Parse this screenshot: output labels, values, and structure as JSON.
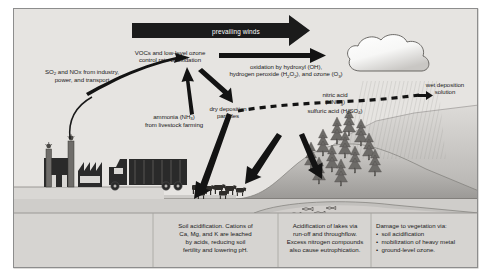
{
  "figure": {
    "panel_bg": "#e6e4e1",
    "ink": "#1a1a1a"
  },
  "banner": {
    "label": "prevailing winds",
    "color": "#1b1b1b",
    "text_color": "#ffffff"
  },
  "labels": {
    "sources": "SO2 and NOx from industry, power, and transport",
    "sources_l1": "SO",
    "sources_l1b": " and NOx from industry,",
    "sources_l2": "power, and transport",
    "vocs_l1": "VOCs and low-level ozone",
    "vocs_l2": "control rate of oxidation",
    "oxidation_l1": "oxidation by hydroxyl (OH),",
    "oxidation_l2a": "hydrogen peroxide (H",
    "oxidation_l2b": "O",
    "oxidation_l2c": "), and ozone (O",
    "oxidation_l2d": ")",
    "ammonia_l1a": "ammonia (NH",
    "ammonia_l1b": ")",
    "ammonia_l2": "from livestock farming",
    "dry_dep_l1": "dry deposition",
    "dry_dep_l2": "particles",
    "acids_l1": "nitric acid",
    "acids_l2a": "(HNO",
    "acids_l2b": ")",
    "acids_l3a": "sulfuric acid (H",
    "acids_l3b": "SO",
    "acids_l3c": ")",
    "wet_dep_l1": "wet deposition",
    "wet_dep_l2": "solution"
  },
  "bottom_boxes": [
    {
      "name": "soil-acidification",
      "lines": [
        "Soil acidification. Cations of",
        "Ca, Mg, and K are leached",
        "by acids, reducing soil",
        "fertility and lowering pH."
      ]
    },
    {
      "name": "lake-acidification",
      "lines": [
        "Acidification of lakes via",
        "run-off and throughflow.",
        "Excess nitrogen compounds",
        "also cause eutrophication."
      ]
    },
    {
      "name": "vegetation-damage",
      "heading": "Damage to vegetation via:",
      "bullets": [
        "soil acidification",
        "mobilization of heavy metal",
        "ground-level ozone."
      ]
    }
  ],
  "scene_icons": {
    "factory": "factory-icon",
    "truck": "truck-icon",
    "livestock": "cattle-herd-icon",
    "cloud": "rain-cloud-icon",
    "forest": "conifer-forest-icon",
    "fish": "fish-in-lake-icon",
    "hill": "hill-icon"
  }
}
